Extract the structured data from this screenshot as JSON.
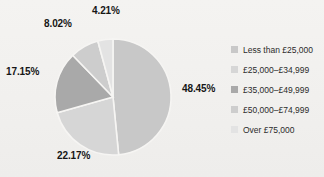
{
  "chart_data": {
    "type": "pie",
    "title": "",
    "subtitle": "",
    "xlabel": "",
    "ylabel": "",
    "grid": false,
    "legend_position": "right",
    "start_angle_deg": 0,
    "direction": "clockwise",
    "categories": [
      "Less than £25,000",
      "£25,000–£34,999",
      "£35,000–£49,999",
      "£50,000–£74,999",
      "Over £75,000"
    ],
    "values": [
      48.45,
      22.17,
      17.15,
      8.02,
      4.21
    ],
    "value_labels": [
      "48.45%",
      "22.17%",
      "17.15%",
      "8.02%",
      "4.21%"
    ],
    "colors": [
      "#c8c8c8",
      "#d6d6d6",
      "#a9a9a9",
      "#cdcdcd",
      "#e3e3e3"
    ],
    "units": "percent",
    "total": 100.0
  },
  "labels": {
    "slice_0": "48.45%",
    "slice_1": "22.17%",
    "slice_2": "17.15%",
    "slice_3": "8.02%",
    "slice_4": "4.21%"
  },
  "legend": {
    "items": [
      {
        "label": "Less than £25,000",
        "color": "#c8c8c8"
      },
      {
        "label": "£25,000–£34,999",
        "color": "#d6d6d6"
      },
      {
        "label": "£35,000–£49,999",
        "color": "#a9a9a9"
      },
      {
        "label": "£50,000–£74,999",
        "color": "#cdcdcd"
      },
      {
        "label": "Over £75,000",
        "color": "#e3e3e3"
      }
    ]
  },
  "style": {
    "background": "#f3f2f0",
    "label_color": "#161616",
    "legend_text_color": "#2b2b2b",
    "slice_divider": "#f6f5f3"
  }
}
